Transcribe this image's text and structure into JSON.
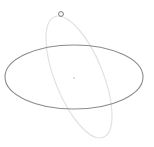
{
  "gizmo": {
    "type": "rotation-gizmo",
    "colors": {
      "background": "#ffffff",
      "horizontal_ring": "#8c8c8c",
      "tilted_ring": "#e2e2e2",
      "handle": "#7a7a7a",
      "center": "#d6d6d6"
    },
    "horizontal_ring": {
      "cx": 74,
      "cy": 77,
      "rx": 69,
      "ry": 32
    },
    "tilted_ring": {
      "cx": 79,
      "cy": 77,
      "rx": 24,
      "ry": 65,
      "rotate": -22
    },
    "handle": {
      "cx": 61,
      "cy": 14,
      "r": 2.4
    },
    "center": {
      "cx": 74,
      "cy": 78,
      "r": 1
    }
  }
}
